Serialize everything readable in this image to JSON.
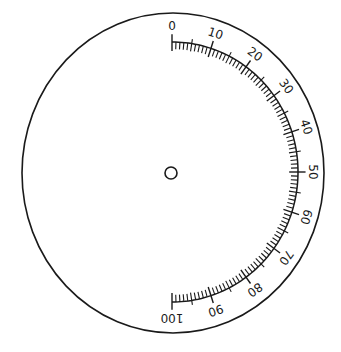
{
  "diagram": {
    "type": "circular-scale-dial",
    "outer_ellipse": {
      "cx": 173,
      "cy": 173,
      "rx": 151,
      "ry": 160
    },
    "center_hole": {
      "cx": 171,
      "cy": 173,
      "r": 6
    },
    "scale": {
      "min": 0,
      "max": 100,
      "start_angle_deg": -90,
      "end_angle_deg": 90,
      "arc_center": {
        "cx": 172,
        "cy": 172
      },
      "arc_rx": 126,
      "arc_ry": 130,
      "minor_step": 1,
      "mid_step": 5,
      "major_step": 10,
      "labels": [
        "0",
        "10",
        "20",
        "30",
        "40",
        "50",
        "60",
        "70",
        "80",
        "90",
        "100"
      ]
    },
    "stroke_color": "#1a1a1a",
    "background_color": "#ffffff"
  }
}
